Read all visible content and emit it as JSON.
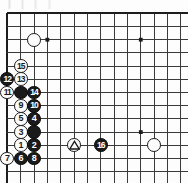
{
  "diagram": {
    "type": "go-board-diagram",
    "title": "",
    "board": {
      "columns": 14,
      "rows": 13,
      "origin_x": 7.3,
      "origin_y": 13.3,
      "step_x": 13.35,
      "step_y": 13.2,
      "edge_top": true,
      "edge_left": true,
      "line_color": "#3a3a3a",
      "edge_color": "#1c1c1c",
      "background": "#fdfdfd"
    },
    "star_points": [
      {
        "col": 3,
        "row": 2
      },
      {
        "col": 10,
        "row": 2
      },
      {
        "col": 10,
        "row": 9
      }
    ],
    "stones": [
      {
        "label": "",
        "color": "white",
        "col": 2,
        "row": 2,
        "mark": ""
      },
      {
        "label": "15",
        "color": "white",
        "col": 1,
        "row": 4,
        "mark": ""
      },
      {
        "label": "12",
        "color": "black",
        "col": 0,
        "row": 5,
        "mark": ""
      },
      {
        "label": "13",
        "color": "white",
        "col": 1,
        "row": 5,
        "mark": ""
      },
      {
        "label": "11",
        "color": "white",
        "col": 0,
        "row": 6,
        "mark": ""
      },
      {
        "label": "",
        "color": "black",
        "col": 1,
        "row": 6,
        "mark": ""
      },
      {
        "label": "14",
        "color": "black",
        "col": 2,
        "row": 6,
        "mark": ""
      },
      {
        "label": "9",
        "color": "white",
        "col": 1,
        "row": 7,
        "mark": ""
      },
      {
        "label": "10",
        "color": "black",
        "col": 2,
        "row": 7,
        "mark": ""
      },
      {
        "label": "5",
        "color": "white",
        "col": 1,
        "row": 8,
        "mark": ""
      },
      {
        "label": "4",
        "color": "black",
        "col": 2,
        "row": 8,
        "mark": ""
      },
      {
        "label": "3",
        "color": "white",
        "col": 1,
        "row": 9,
        "mark": ""
      },
      {
        "label": "",
        "color": "black",
        "col": 2,
        "row": 9,
        "mark": ""
      },
      {
        "label": "1",
        "color": "white",
        "col": 1,
        "row": 10,
        "mark": ""
      },
      {
        "label": "2",
        "color": "black",
        "col": 2,
        "row": 10,
        "mark": ""
      },
      {
        "label": "",
        "color": "white",
        "col": 5,
        "row": 10,
        "mark": "triangle"
      },
      {
        "label": "16",
        "color": "black",
        "col": 7,
        "row": 10,
        "mark": ""
      },
      {
        "label": "",
        "color": "white",
        "col": 11,
        "row": 10,
        "mark": ""
      },
      {
        "label": "7",
        "color": "white",
        "col": 0,
        "row": 11,
        "mark": ""
      },
      {
        "label": "6",
        "color": "black",
        "col": 1,
        "row": 11,
        "mark": ""
      },
      {
        "label": "8",
        "color": "black",
        "col": 2,
        "row": 11,
        "mark": ""
      }
    ]
  }
}
